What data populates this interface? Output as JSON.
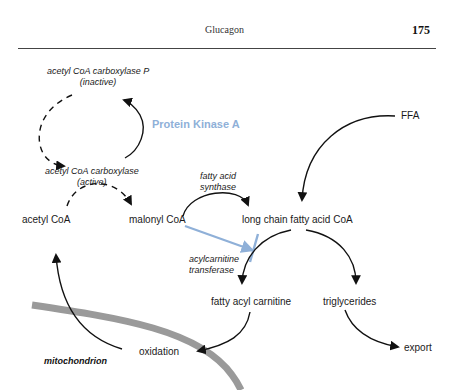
{
  "running_head": {
    "title": "Glucagon",
    "page_number": "175"
  },
  "diagram": {
    "enzyme_labels": {
      "acc_p_line1": "acetyl CoA carboxylase P",
      "acc_p_line2": "(inactive)",
      "acc_line1": "acetyl CoA carboxylase",
      "acc_line2": "(active)",
      "fas_line1": "fatty acid",
      "fas_line2": "synthase",
      "act_line1": "acylcarnitine",
      "act_line2": "transferase"
    },
    "regulator": {
      "label": "Protein Kinase A",
      "color": "#8fb0d8"
    },
    "metabolites": {
      "acetyl_coa": "acetyl CoA",
      "malonyl_coa": "malonyl CoA",
      "long_chain": "long chain fatty acid CoA",
      "ffa": "FFA",
      "fatty_acyl_carnitine": "fatty acyl carnitine",
      "triglycerides": "triglycerides",
      "oxidation": "oxidation",
      "export": "export"
    },
    "compartment": {
      "label": "mitochondrion",
      "membrane_color": "#9a9a9a"
    }
  }
}
